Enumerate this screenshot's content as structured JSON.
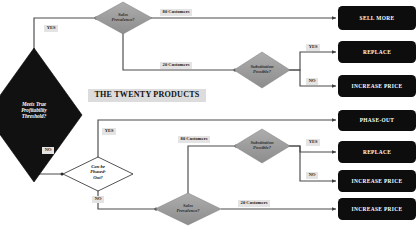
{
  "title_banner": {
    "label": "THE TWENTY PRODUCTS"
  },
  "colors": {
    "dark_node": "#111111",
    "gray_node": "#9a9a9a",
    "white_node": "#ffffff",
    "terminal_fill": "#0d0d0d",
    "terminal_text": "#ffffff",
    "edge_line": "#4a4a4a",
    "label_bg": "#e4e4e4",
    "page_bg": "#ffffff"
  },
  "decisions": [
    {
      "id": "profitability",
      "label": "Meets True\nProfitability\nThreshold?",
      "style": "dark"
    },
    {
      "id": "sales-prevalence-top",
      "label": "Sales\nPrevalence?",
      "style": "gray"
    },
    {
      "id": "substitution-top",
      "label": "Substitution\nPossible?",
      "style": "gray"
    },
    {
      "id": "phase-out",
      "label": "Can be\nPhased-\nOut?",
      "style": "white"
    },
    {
      "id": "substitution-bottom",
      "label": "Substitution\nPossible?",
      "style": "gray"
    },
    {
      "id": "sales-prevalence-bottom",
      "label": "Sales\nPrevalence?",
      "style": "gray"
    }
  ],
  "terminals": [
    {
      "id": "sell-more",
      "label": "SELL MORE"
    },
    {
      "id": "replace-top",
      "label": "REPLACE"
    },
    {
      "id": "increase-price-top",
      "label": "INCREASE PRICE"
    },
    {
      "id": "phase-out-terminal",
      "label": "PHASE-OUT"
    },
    {
      "id": "replace-bottom",
      "label": "REPLACE"
    },
    {
      "id": "increase-price-mid",
      "label": "INCREASE PRICE"
    },
    {
      "id": "increase-price-bottom",
      "label": "INCREASE PRICE"
    }
  ],
  "edge_labels": [
    {
      "id": "customers-80-top",
      "label": "80 Customers"
    },
    {
      "id": "customers-20-top",
      "label": "20 Customers"
    },
    {
      "id": "customers-80-bottom",
      "label": "80 Customers"
    },
    {
      "id": "customers-20-bottom",
      "label": "20 Customers"
    }
  ],
  "branch_labels": [
    {
      "id": "profitability-yes",
      "label": "YES"
    },
    {
      "id": "profitability-no",
      "label": "NO"
    },
    {
      "id": "substitution-top-yes",
      "label": "YES"
    },
    {
      "id": "substitution-top-no",
      "label": "NO"
    },
    {
      "id": "phase-out-yes",
      "label": "YES"
    },
    {
      "id": "phase-out-no",
      "label": "NO"
    },
    {
      "id": "substitution-bottom-yes",
      "label": "YES"
    },
    {
      "id": "substitution-bottom-no",
      "label": "NO"
    }
  ]
}
